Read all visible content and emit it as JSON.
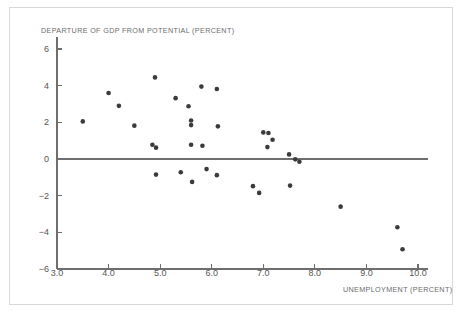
{
  "chart_data": {
    "type": "scatter",
    "title": "",
    "ylabel": "DEPARTURE OF GDP FROM POTENTIAL (PERCENT)",
    "xlabel": "UNEMPLOYMENT (PERCENT)",
    "xlim": [
      3.0,
      10.0
    ],
    "ylim": [
      -6,
      6
    ],
    "xticks": [
      "3.0",
      "4.0",
      "5.0",
      "6.0",
      "7.0",
      "8.0",
      "9.0",
      "10.0"
    ],
    "xtick_values": [
      3.0,
      4.0,
      5.0,
      6.0,
      7.0,
      8.0,
      9.0,
      10.0
    ],
    "yticks": [
      "6",
      "4",
      "2",
      "0",
      "−2",
      "−4",
      "−6"
    ],
    "ytick_values": [
      6,
      4,
      2,
      0,
      -2,
      -4,
      -6
    ],
    "grid": false,
    "legend": null,
    "zero_line": 0,
    "marker_color": "#3b3b3b",
    "marker_size": 4.6,
    "axis_color": "#6e6e6e",
    "frame_color": "#d8d8d8",
    "background": "#ffffff",
    "points": [
      {
        "x": 3.5,
        "y": 2.05
      },
      {
        "x": 4.0,
        "y": 3.6
      },
      {
        "x": 4.2,
        "y": 2.9
      },
      {
        "x": 4.5,
        "y": 1.82
      },
      {
        "x": 4.85,
        "y": 0.78
      },
      {
        "x": 4.92,
        "y": 0.62
      },
      {
        "x": 4.9,
        "y": 4.45
      },
      {
        "x": 4.92,
        "y": -0.85
      },
      {
        "x": 5.3,
        "y": 3.32
      },
      {
        "x": 5.4,
        "y": -0.72
      },
      {
        "x": 5.55,
        "y": 2.88
      },
      {
        "x": 5.6,
        "y": 2.1
      },
      {
        "x": 5.6,
        "y": 1.85
      },
      {
        "x": 5.6,
        "y": 0.78
      },
      {
        "x": 5.62,
        "y": -1.25
      },
      {
        "x": 5.8,
        "y": 3.95
      },
      {
        "x": 5.82,
        "y": 0.72
      },
      {
        "x": 5.9,
        "y": -0.55
      },
      {
        "x": 6.1,
        "y": 3.82
      },
      {
        "x": 6.12,
        "y": 1.78
      },
      {
        "x": 6.1,
        "y": -0.88
      },
      {
        "x": 6.8,
        "y": -1.48
      },
      {
        "x": 6.92,
        "y": -1.85
      },
      {
        "x": 7.0,
        "y": 1.45
      },
      {
        "x": 7.1,
        "y": 1.42
      },
      {
        "x": 7.18,
        "y": 1.05
      },
      {
        "x": 7.08,
        "y": 0.65
      },
      {
        "x": 7.5,
        "y": 0.25
      },
      {
        "x": 7.52,
        "y": -1.45
      },
      {
        "x": 7.62,
        "y": -0.02
      },
      {
        "x": 7.7,
        "y": -0.15
      },
      {
        "x": 8.5,
        "y": -2.6
      },
      {
        "x": 9.6,
        "y": -3.72
      },
      {
        "x": 9.7,
        "y": -4.92
      }
    ]
  }
}
